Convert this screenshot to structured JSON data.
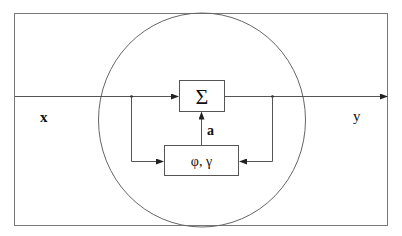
{
  "diagram": {
    "input_label": "x",
    "output_label": "y",
    "sum_block": {
      "label": "Σ"
    },
    "param_block": {
      "label": "φ, γ"
    },
    "control_signal_label": "a",
    "colors": {
      "stroke": "#555555",
      "background": "#ffffff",
      "text": "#111111"
    }
  }
}
